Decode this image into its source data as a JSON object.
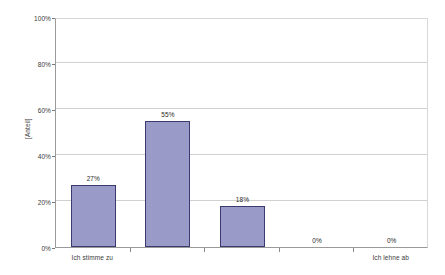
{
  "chart_data": {
    "type": "bar",
    "title": "",
    "subtitle": "",
    "xlabel": "",
    "ylabel": "[Anteil]",
    "ylim": [
      0,
      100
    ],
    "y_unit": "%",
    "grid": true,
    "legend": "none",
    "categories": [
      "Ich stimme zu",
      "",
      "",
      "",
      "Ich lehne ab"
    ],
    "visible_category_labels": [
      {
        "index": 0,
        "label": "Ich stimme zu"
      },
      {
        "index": 4,
        "label": "Ich lehne ab"
      }
    ],
    "values": [
      27,
      55,
      18,
      0,
      0
    ],
    "data_labels": [
      "27%",
      "55%",
      "18%",
      "0%",
      "0%"
    ],
    "y_ticks": [
      0,
      20,
      40,
      60,
      80,
      100
    ],
    "y_tick_labels": [
      "0%",
      "20%",
      "40%",
      "60%",
      "80%",
      "100%"
    ],
    "colors": {
      "bar_fill": "#9a9ac9",
      "bar_border": "#3a3a6e",
      "gridline": "#d0d0d0",
      "axis": "#9a9a9a",
      "text": "#3a3a3a",
      "background": "#ffffff"
    }
  }
}
